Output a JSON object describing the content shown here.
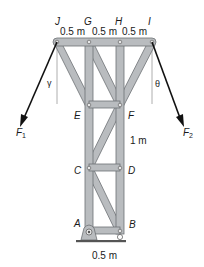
{
  "figure": {
    "type": "truss-diagram",
    "joints": {
      "J": "J",
      "G": "G",
      "H": "H",
      "I": "I",
      "E": "E",
      "F": "F",
      "C": "C",
      "D": "D",
      "A": "A",
      "B": "B"
    },
    "dimensions": {
      "top_span_1": "0.5 m",
      "top_span_2": "0.5 m",
      "top_span_3": "0.5 m",
      "panel_height": "1 m",
      "base_width": "0.5 m"
    },
    "forces": {
      "left": {
        "name": "F",
        "subscript": "1"
      },
      "right": {
        "name": "F",
        "subscript": "2"
      }
    },
    "angles": {
      "left": "γ",
      "right": "θ"
    },
    "colors": {
      "member_fill": "#b9bcbf",
      "member_edge": "#6d7175",
      "arrow": "#111111",
      "guide_line": "#9a9a9a",
      "ground": "#555555"
    }
  }
}
